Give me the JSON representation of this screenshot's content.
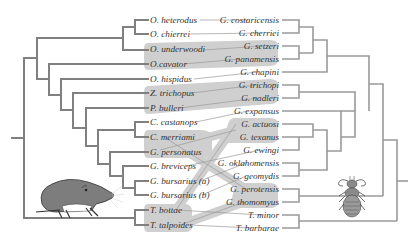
{
  "figure": {
    "type": "tanglegram",
    "host_icon": "gopher-illustration",
    "parasite_icon": "louse-illustration"
  },
  "colors": {
    "tree_branch": "#808080",
    "association_band": "#cfcfcf",
    "association_line": "#9a9a9a",
    "label_text": "#333333"
  },
  "hosts": {
    "taxa": [
      {
        "label": "O. heterodus",
        "y": 20
      },
      {
        "label": "O. chierrei",
        "y": 34
      },
      {
        "label": "O. underwoodi",
        "y": 49
      },
      {
        "label": "O.cavator",
        "y": 64
      },
      {
        "label": "O. hispidus",
        "y": 79
      },
      {
        "label": "Z. trichopus",
        "y": 93
      },
      {
        "label": "P. bulleri",
        "y": 108
      },
      {
        "label": "C. castanops",
        "y": 122
      },
      {
        "label": "C. merriami",
        "y": 137
      },
      {
        "label": "G. personatus",
        "y": 152
      },
      {
        "label": "G. breviceps",
        "y": 166
      },
      {
        "label": "G. bursarius (a)",
        "y": 181
      },
      {
        "label": "G. bursarius (b)",
        "y": 195
      },
      {
        "label": "T. bottae",
        "y": 210
      },
      {
        "label": "T. talpoides",
        "y": 225
      }
    ]
  },
  "parasites": {
    "taxa": [
      {
        "label": "G. costaricensis",
        "y": 20
      },
      {
        "label": "G. cherriei",
        "y": 33
      },
      {
        "label": "G. setzeri",
        "y": 46
      },
      {
        "label": "G. panamensis",
        "y": 59
      },
      {
        "label": "G. chapini",
        "y": 72
      },
      {
        "label": "G. trichopi",
        "y": 85
      },
      {
        "label": "G. nadleri",
        "y": 98
      },
      {
        "label": "G. expansus",
        "y": 111
      },
      {
        "label": "G. actuosi",
        "y": 124
      },
      {
        "label": "G. texanus",
        "y": 137
      },
      {
        "label": "G. ewingi",
        "y": 150
      },
      {
        "label": "G. oklahomensis",
        "y": 163
      },
      {
        "label": "G. geomydis",
        "y": 176
      },
      {
        "label": "G. perotensis",
        "y": 189
      },
      {
        "label": "G. thomomyus",
        "y": 202
      },
      {
        "label": "T. minor",
        "y": 215
      },
      {
        "label": "T. barbarae",
        "y": 228
      }
    ]
  },
  "associations": [
    {
      "host": "O. heterodus",
      "parasite": "G. costaricensis",
      "cospeciation": false
    },
    {
      "host": "O. chierrei",
      "parasite": "G. cherriei",
      "cospeciation": false
    },
    {
      "host": "O. underwoodi",
      "parasite": "G. setzeri",
      "cospeciation": true
    },
    {
      "host": "O.cavator",
      "parasite": "G. panamensis",
      "cospeciation": true
    },
    {
      "host": "O. hispidus",
      "parasite": "G. chapini",
      "cospeciation": false
    },
    {
      "host": "Z. trichopus",
      "parasite": "G. trichopi",
      "cospeciation": true
    },
    {
      "host": "P. bulleri",
      "parasite": "G. nadleri",
      "cospeciation": true
    },
    {
      "host": "P. bulleri",
      "parasite": "G. expansus",
      "cospeciation": false
    },
    {
      "host": "C. castanops",
      "parasite": "G. expansus",
      "cospeciation": false
    },
    {
      "host": "C. merriami",
      "parasite": "G. perotensis",
      "cospeciation": true
    },
    {
      "host": "G. personatus",
      "parasite": "G. texanus",
      "cospeciation": true
    },
    {
      "host": "G. personatus",
      "parasite": "G. ewingi",
      "cospeciation": false
    },
    {
      "host": "G. breviceps",
      "parasite": "G. oklahomensis",
      "cospeciation": false
    },
    {
      "host": "G. bursarius (a)",
      "parasite": "G. geomydis",
      "cospeciation": false
    },
    {
      "host": "G. bursarius (b)",
      "parasite": "G. geomydis",
      "cospeciation": false
    },
    {
      "host": "T. bottae",
      "parasite": "G. actuosi",
      "cospeciation": true
    },
    {
      "host": "T. bottae",
      "parasite": "T. minor",
      "cospeciation": false
    },
    {
      "host": "T. talpoides",
      "parasite": "G. thomomyus",
      "cospeciation": true
    },
    {
      "host": "T. talpoides",
      "parasite": "T. barbarae",
      "cospeciation": false
    }
  ]
}
